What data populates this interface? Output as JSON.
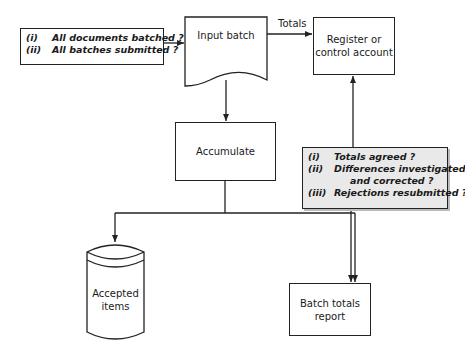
{
  "diagram": {
    "nodes": {
      "input_batch": {
        "label": "Input batch",
        "shape": "document"
      },
      "register": {
        "label_line1": "Register or",
        "label_line2": "control account",
        "shape": "rectangle"
      },
      "accumulate": {
        "label": "Accumulate",
        "shape": "rectangle"
      },
      "accepted_items": {
        "label_line1": "Accepted",
        "label_line2": "items",
        "shape": "cylinder"
      },
      "batch_totals": {
        "label_line1": "Batch totals",
        "label_line2": "report",
        "shape": "rectangle"
      }
    },
    "edge_labels": {
      "totals": "Totals"
    },
    "input_checks": {
      "items": [
        {
          "num": "(i)",
          "text": "All documents batched ?"
        },
        {
          "num": "(ii)",
          "text": "All batches submitted ?"
        }
      ]
    },
    "output_checks": {
      "items": [
        {
          "num": "(i)",
          "text": "Totals agreed ?"
        },
        {
          "num": "(ii)",
          "text": "Differences investigated",
          "text2": "and corrected ?"
        },
        {
          "num": "(iii)",
          "text": "Rejections resubmitted ?"
        }
      ]
    },
    "edges": [
      {
        "from": "input_checks",
        "to": "input_batch"
      },
      {
        "from": "input_batch",
        "to": "register",
        "label": "Totals"
      },
      {
        "from": "input_batch",
        "to": "accumulate"
      },
      {
        "from": "accumulate",
        "to": "accepted_items"
      },
      {
        "from": "accumulate",
        "to": "batch_totals"
      },
      {
        "from": "output_checks",
        "to": "register"
      },
      {
        "from": "output_checks",
        "to": "batch_totals"
      }
    ]
  }
}
